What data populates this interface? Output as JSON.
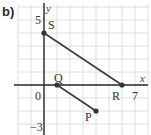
{
  "part_label": "b)",
  "axes": {
    "x_label": "x",
    "y_label": "y",
    "tick_labels": {
      "origin": "0",
      "x_max": "7",
      "y_max": "5",
      "y_min": "−3"
    }
  },
  "grid": {
    "x_min": -2,
    "x_max": 8,
    "y_min": -3,
    "y_max": 6,
    "step": 1,
    "color": "#d6d6d6"
  },
  "points": [
    {
      "name": "S",
      "x": 0,
      "y": 4
    },
    {
      "name": "R",
      "x": 6,
      "y": 0
    },
    {
      "name": "Q",
      "x": 1,
      "y": 0
    },
    {
      "name": "P",
      "x": 4,
      "y": -2
    }
  ],
  "segments": [
    {
      "from": "S",
      "to": "R"
    },
    {
      "from": "Q",
      "to": "P"
    }
  ],
  "colors": {
    "line": "#3a3a3a",
    "axis": "#2a2a2a",
    "point": "#333333"
  }
}
